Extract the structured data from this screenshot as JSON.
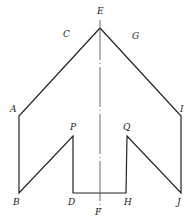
{
  "diagram": {
    "type": "geometric-figure",
    "stroke_color": "#222222",
    "points": {
      "E": {
        "x": 100,
        "y": 28
      },
      "A": {
        "x": 19,
        "y": 116
      },
      "B": {
        "x": 19,
        "y": 193
      },
      "P": {
        "x": 73,
        "y": 136
      },
      "D": {
        "x": 73,
        "y": 193
      },
      "H": {
        "x": 126,
        "y": 193
      },
      "Q": {
        "x": 127,
        "y": 136
      },
      "J": {
        "x": 181,
        "y": 193
      },
      "I": {
        "x": 181,
        "y": 116
      },
      "F": {
        "x": 100,
        "y": 210
      }
    },
    "labels": {
      "E": "E",
      "C": "C",
      "G": "G",
      "A": "A",
      "I": "I",
      "P": "P",
      "Q": "Q",
      "B": "B",
      "D": "D",
      "H": "H",
      "J": "J",
      "F": "F"
    },
    "outline_order": [
      "E",
      "A",
      "B",
      "P",
      "D",
      "H",
      "Q",
      "J",
      "I",
      "E"
    ],
    "axis": {
      "from": "E",
      "to": "F",
      "style": "dash-dot"
    }
  }
}
